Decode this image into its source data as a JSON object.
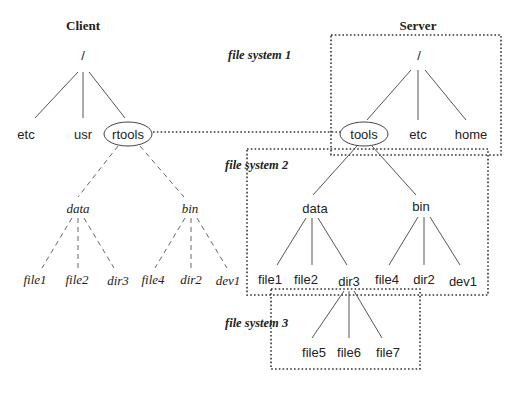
{
  "client": {
    "title": "Client",
    "root": "/",
    "children": [
      "etc",
      "usr",
      "rtools"
    ],
    "mounted": {
      "dirs": [
        "data",
        "bin"
      ],
      "data_children": [
        "file1",
        "file2",
        "dir3"
      ],
      "bin_children": [
        "file4",
        "dir2",
        "dev1"
      ]
    }
  },
  "server": {
    "title": "Server",
    "root": "/",
    "children": [
      "tools",
      "etc",
      "home"
    ],
    "dirs": [
      "data",
      "bin"
    ],
    "data_children": [
      "file1",
      "file2",
      "dir3"
    ],
    "bin_children": [
      "file4",
      "dir2",
      "dev1"
    ],
    "dir3_children": [
      "file5",
      "file6",
      "file7"
    ]
  },
  "file_systems": [
    {
      "label": "file system 1"
    },
    {
      "label": "file system 2"
    },
    {
      "label": "file system 3"
    }
  ],
  "style": {
    "line_color": "#555555",
    "text_color": "#222222",
    "background": "#ffffff"
  }
}
